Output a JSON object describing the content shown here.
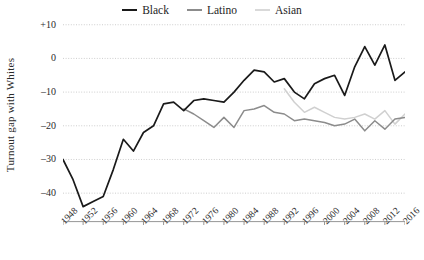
{
  "chart_data": {
    "type": "line",
    "title": "",
    "xlabel": "",
    "ylabel": "Turnout gap with Whites",
    "xlim": [
      1948,
      2016
    ],
    "ylim": [
      -45,
      12
    ],
    "yticks": [
      10,
      0,
      -10,
      -20,
      -30,
      -40
    ],
    "ytick_labels": [
      "+10",
      "0",
      "–10",
      "–20",
      "–30",
      "–40"
    ],
    "grid": "horizontal-dotted",
    "legend_position": "top-center",
    "categories": [
      1948,
      1952,
      1956,
      1960,
      1964,
      1968,
      1972,
      1976,
      1980,
      1984,
      1988,
      1992,
      1996,
      2000,
      2004,
      2008,
      2012,
      2016
    ],
    "series": [
      {
        "name": "Black",
        "color": "#1a1a1a",
        "x": [
          1948,
          1952,
          1956,
          1960,
          1964,
          1968,
          1972,
          1976,
          1980,
          1984,
          1988,
          1992,
          1996,
          2000,
          2004,
          2008,
          2012,
          2016
        ],
        "values": [
          -30,
          -44,
          -41,
          -25,
          -30,
          -17,
          -20,
          -14,
          -13,
          -14,
          -11,
          -9,
          -11,
          -12,
          -13,
          -14,
          -13,
          -12
        ]
      },
      {
        "name": "Latino",
        "color": "#8c8c8c",
        "x": [
          1972,
          1976,
          1980,
          1984,
          1988,
          1992,
          1996,
          2000,
          2004,
          2008,
          2012,
          2016
        ],
        "values": [
          -15,
          -18,
          -21,
          -16,
          -20,
          -14,
          -17,
          -16,
          -18,
          -19,
          -18,
          -17
        ]
      },
      {
        "name": "Asian",
        "color": "#d0d0d0",
        "x": [
          1992,
          1996,
          2000,
          2004,
          2008,
          2012,
          2016
        ],
        "values": [
          -9,
          -14,
          -16,
          -17,
          -18,
          -17,
          -17
        ]
      }
    ],
    "series_detail": [
      {
        "name": "Black",
        "points": [
          [
            1948,
            -30.0
          ],
          [
            1950,
            -36.0
          ],
          [
            1952,
            -44.0
          ],
          [
            1954,
            -42.5
          ],
          [
            1956,
            -41.0
          ],
          [
            1958,
            -33.0
          ],
          [
            1960,
            -24.0
          ],
          [
            1962,
            -27.5
          ],
          [
            1964,
            -22.0
          ],
          [
            1966,
            -20.0
          ],
          [
            1968,
            -13.5
          ],
          [
            1970,
            -13.0
          ],
          [
            1972,
            -15.5
          ],
          [
            1974,
            -12.5
          ],
          [
            1976,
            -12.0
          ],
          [
            1978,
            -12.5
          ],
          [
            1980,
            -13.0
          ],
          [
            1982,
            -10.0
          ],
          [
            1984,
            -6.5
          ],
          [
            1986,
            -3.5
          ],
          [
            1988,
            -4.0
          ],
          [
            1990,
            -7.0
          ],
          [
            1992,
            -6.0
          ],
          [
            1994,
            -10.0
          ],
          [
            1996,
            -12.0
          ],
          [
            1998,
            -7.5
          ],
          [
            2000,
            -6.0
          ],
          [
            2002,
            -5.0
          ],
          [
            2004,
            -11.0
          ],
          [
            2006,
            -2.5
          ],
          [
            2008,
            3.5
          ],
          [
            2010,
            -2.0
          ],
          [
            2012,
            4.0
          ],
          [
            2014,
            -6.5
          ],
          [
            2016,
            -4.0
          ]
        ]
      },
      {
        "name": "Latino",
        "points": [
          [
            1972,
            -15.0
          ],
          [
            1974,
            -16.5
          ],
          [
            1976,
            -18.5
          ],
          [
            1978,
            -20.5
          ],
          [
            1980,
            -17.5
          ],
          [
            1982,
            -20.5
          ],
          [
            1984,
            -15.5
          ],
          [
            1986,
            -15.0
          ],
          [
            1988,
            -14.0
          ],
          [
            1990,
            -16.0
          ],
          [
            1992,
            -16.5
          ],
          [
            1994,
            -18.5
          ],
          [
            1996,
            -18.0
          ],
          [
            1998,
            -18.5
          ],
          [
            2000,
            -19.0
          ],
          [
            2002,
            -20.0
          ],
          [
            2004,
            -19.5
          ],
          [
            2006,
            -18.0
          ],
          [
            2008,
            -21.5
          ],
          [
            2010,
            -18.5
          ],
          [
            2012,
            -21.0
          ],
          [
            2014,
            -18.0
          ],
          [
            2016,
            -17.5
          ]
        ]
      },
      {
        "name": "Asian",
        "points": [
          [
            1992,
            -9.0
          ],
          [
            1994,
            -13.0
          ],
          [
            1996,
            -16.0
          ],
          [
            1998,
            -14.5
          ],
          [
            2000,
            -16.0
          ],
          [
            2002,
            -17.5
          ],
          [
            2004,
            -18.0
          ],
          [
            2006,
            -17.5
          ],
          [
            2008,
            -16.5
          ],
          [
            2010,
            -18.0
          ],
          [
            2012,
            -15.5
          ],
          [
            2014,
            -19.5
          ],
          [
            2016,
            -16.5
          ]
        ]
      }
    ]
  },
  "legend": {
    "items": [
      {
        "label": "Black",
        "color": "#1a1a1a"
      },
      {
        "label": "Latino",
        "color": "#8c8c8c"
      },
      {
        "label": "Asian",
        "color": "#d9d9d9"
      }
    ]
  },
  "axes": {
    "y_title": "Turnout gap with Whites",
    "y_labels": [
      "+10",
      "0",
      "–10",
      "–20",
      "–30",
      "–40"
    ],
    "x_labels": [
      "1948",
      "1952",
      "1956",
      "1960",
      "1964",
      "1968",
      "1972",
      "1976",
      "1980",
      "1984",
      "1988",
      "1992",
      "1996",
      "2000",
      "2004",
      "2008",
      "2012",
      "2016"
    ]
  },
  "colors": {
    "black_series": "#1a1a1a",
    "latino_series": "#8c8c8c",
    "asian_series": "#d9d9d9",
    "grid": "#c8c8c8",
    "axis": "#8a8a8a",
    "text": "#2b2b2b",
    "background": "#ffffff"
  }
}
